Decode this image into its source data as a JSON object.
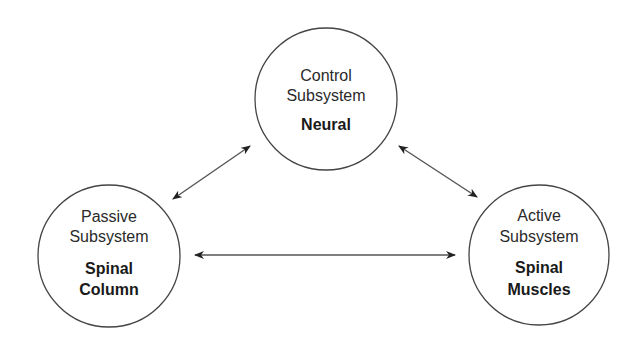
{
  "diagram": {
    "type": "three-node bidirectional relationship diagram",
    "nodes": [
      {
        "id": "control",
        "title_line1": "Control",
        "title_line2": "Subsystem",
        "component_line1": "Neural",
        "component_line2": ""
      },
      {
        "id": "passive",
        "title_line1": "Passive",
        "title_line2": "Subsystem",
        "component_line1": "Spinal",
        "component_line2": "Column"
      },
      {
        "id": "active",
        "title_line1": "Active",
        "title_line2": "Subsystem",
        "component_line1": "Spinal",
        "component_line2": "Muscles"
      }
    ],
    "edges": [
      {
        "from": "passive",
        "to": "control",
        "direction": "bidirectional"
      },
      {
        "from": "control",
        "to": "active",
        "direction": "bidirectional"
      },
      {
        "from": "passive",
        "to": "active",
        "direction": "bidirectional"
      }
    ],
    "colors": {
      "stroke": "#444444",
      "text": "#2a2a2a",
      "background": "#ffffff"
    }
  }
}
